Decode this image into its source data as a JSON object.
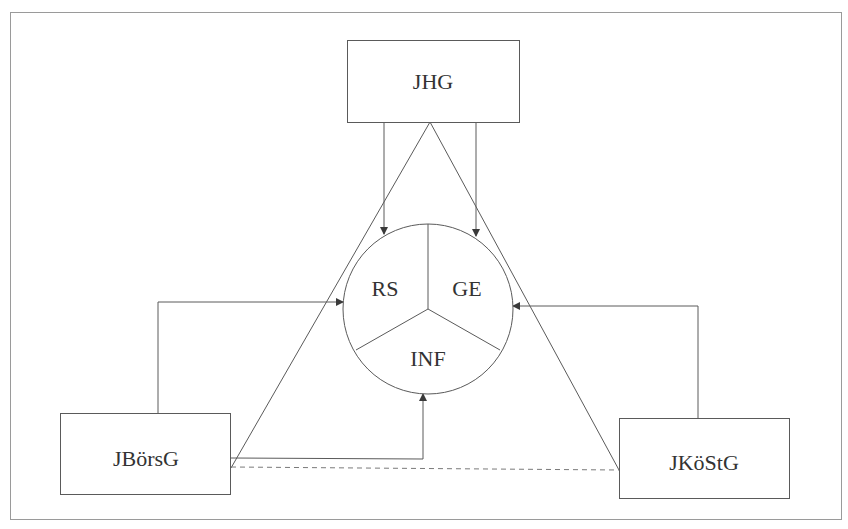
{
  "diagram": {
    "colors": {
      "stroke": "#5a5a5a",
      "frame": "#9a9a9a",
      "text": "#333333",
      "background": "#ffffff"
    },
    "nodes": {
      "jhg": {
        "label": "JHG"
      },
      "jboersg": {
        "label": "JBörsG"
      },
      "jkoestg": {
        "label": "JKöStG"
      }
    },
    "center_circle": {
      "segments": [
        {
          "id": "rs",
          "label": "RS"
        },
        {
          "id": "ge",
          "label": "GE"
        },
        {
          "id": "inf",
          "label": "INF"
        }
      ]
    },
    "connections": [
      {
        "from": "JHG",
        "to": "RS",
        "style": "arrow"
      },
      {
        "from": "JHG",
        "to": "GE",
        "style": "arrow"
      },
      {
        "from": "JBörsG",
        "to": "RS",
        "style": "arrow"
      },
      {
        "from": "JKöStG",
        "to": "GE",
        "style": "arrow"
      },
      {
        "from": "JBörsG",
        "to": "INF",
        "style": "arrow"
      },
      {
        "from": "JBörsG",
        "to": "JKöStG",
        "style": "dashed"
      },
      {
        "from": "JHG",
        "to": "JBörsG",
        "style": "line"
      },
      {
        "from": "JHG",
        "to": "JKöStG",
        "style": "line"
      }
    ]
  }
}
